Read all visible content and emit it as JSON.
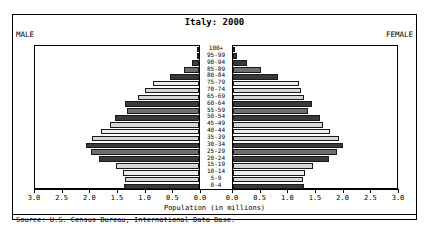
{
  "title": "Italy: 2000",
  "male_label": "MALE",
  "female_label": "FEMALE",
  "xlabel": "Population (in millions)",
  "source": "Source: U.S. Census Bureau, International Data Base.",
  "colors": {
    "bar_dark": "#3a3a3a",
    "bar_mid": "#6e6e6e",
    "bar_light": "#d6d6d6",
    "bar_pale": "#ededed",
    "frame": "#000000",
    "background": "#ffffff"
  },
  "axis": {
    "tick_labels": [
      "3.0",
      "2.5",
      "2.0",
      "1.5",
      "1.0",
      "0.5",
      "0.0",
      "0.0",
      "0.5",
      "1.0",
      "1.5",
      "2.0",
      "2.5",
      "3.0"
    ],
    "max": 3.0,
    "step": 0.5
  },
  "chart_data": {
    "type": "bar",
    "subtype": "population-pyramid",
    "title": "Italy: 2000",
    "xlabel": "Population (in millions)",
    "ylabel": "",
    "xlim": [
      0,
      3.0
    ],
    "grid": false,
    "legend": "none",
    "categories": [
      "100+",
      "95-99",
      "90-94",
      "85-89",
      "80-84",
      "75-79",
      "70-74",
      "65-69",
      "60-64",
      "55-59",
      "50-54",
      "45-49",
      "40-44",
      "35-39",
      "30-34",
      "25-29",
      "20-24",
      "15-19",
      "10-14",
      "5-9",
      "0-4"
    ],
    "series": [
      {
        "name": "MALE",
        "values": [
          0.003,
          0.03,
          0.12,
          0.28,
          0.52,
          0.84,
          0.97,
          1.1,
          1.34,
          1.3,
          1.52,
          1.6,
          1.77,
          1.94,
          2.05,
          1.95,
          1.8,
          1.5,
          1.37,
          1.33,
          1.36
        ]
      },
      {
        "name": "FEMALE",
        "values": [
          0.012,
          0.08,
          0.26,
          0.5,
          0.82,
          1.19,
          1.22,
          1.28,
          1.43,
          1.36,
          1.57,
          1.62,
          1.76,
          1.91,
          1.99,
          1.88,
          1.74,
          1.44,
          1.3,
          1.26,
          1.29
        ]
      }
    ]
  },
  "bar_styles": [
    "bar_dark",
    "bar_dark",
    "bar_dark",
    "bar_mid",
    "bar_dark",
    "bar_pale",
    "bar_light",
    "bar_light",
    "bar_dark",
    "bar_mid",
    "bar_dark",
    "bar_light",
    "bar_pale",
    "bar_light",
    "bar_dark",
    "bar_mid",
    "bar_dark",
    "bar_light",
    "bar_pale",
    "bar_light",
    "bar_dark"
  ]
}
